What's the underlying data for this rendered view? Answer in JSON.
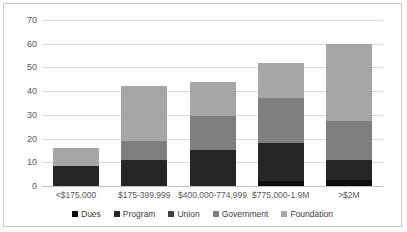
{
  "chart_data": {
    "type": "bar",
    "subtype": "stacked-bar",
    "title": "",
    "xlabel": "",
    "ylabel": "",
    "ylim": [
      0,
      70
    ],
    "yticks": [
      0,
      10,
      20,
      30,
      40,
      50,
      60,
      70
    ],
    "grid": true,
    "legend_position": "bottom",
    "categories": [
      "<$175,000",
      "$175-399,999",
      "$400,000-774,999",
      "$775,000-1.9M",
      ">$2M"
    ],
    "series": [
      {
        "name": "Dues",
        "color": "#0d0d0d",
        "values": [
          0,
          0,
          0,
          2,
          2.5
        ]
      },
      {
        "name": "Program",
        "color": "#262626",
        "values": [
          8.5,
          11,
          15,
          16,
          8.5
        ]
      },
      {
        "name": "Union",
        "color": "#404040",
        "values": [
          0,
          0,
          0,
          0,
          0
        ]
      },
      {
        "name": "Government",
        "color": "#7f7f7f",
        "values": [
          0,
          8,
          14.5,
          19,
          16.5
        ]
      },
      {
        "name": "Foundation",
        "color": "#a6a6a6",
        "values": [
          7.5,
          23,
          14.5,
          15,
          32.5
        ]
      }
    ],
    "totals": [
      16,
      42,
      44,
      52,
      60
    ]
  },
  "colors": {
    "gridline": "#d9d9d9",
    "axis": "#bfbfbf",
    "frame": "#c8c8c8",
    "tick_text": "#595959",
    "legend_text": "#404040",
    "background": "#ffffff"
  }
}
